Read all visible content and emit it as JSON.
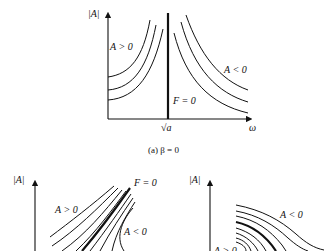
{
  "figure": {
    "panel_a": {
      "y_axis_label": "|A|",
      "x_axis_label": "ω",
      "tick_label": "√a",
      "region_positive": "A > 0",
      "region_negative": "A < 0",
      "backbone_label": "F = 0",
      "caption": "(a) β = 0"
    },
    "panel_b": {
      "y_axis_label": "|A|",
      "region_positive": "A > 0",
      "region_negative": "A < 0",
      "backbone_label": "F = 0"
    },
    "panel_c": {
      "y_axis_label": "|A|",
      "region_positive": "A > 0",
      "region_negative": "A < 0"
    }
  }
}
